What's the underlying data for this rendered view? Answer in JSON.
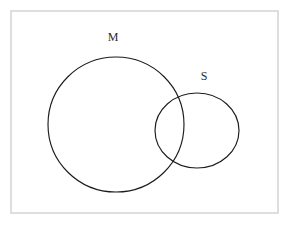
{
  "figure": {
    "type": "euler-diagram",
    "background_color": "#ffffff",
    "frame": {
      "name": "universe-frame",
      "x": 11,
      "y": 11,
      "width": 267,
      "height": 202,
      "stroke_color": "#d6d6d6",
      "stroke_width": 1.6,
      "fill_color": "#ffffff"
    },
    "stroke_color": "#1c1c1c",
    "stroke_width": 1.15,
    "sets": [
      {
        "id": "M",
        "label": "M",
        "shape": "circle",
        "cx": 116,
        "cy": 124.5,
        "rx": 68,
        "ry": 67.5,
        "label_x": 113,
        "label_y": 41
      },
      {
        "id": "S",
        "label": "S",
        "shape": "ellipse",
        "cx": 197,
        "cy": 130.5,
        "rx": 42,
        "ry": 37.5,
        "label_x": 204,
        "label_y": 80
      }
    ],
    "relation": "overlapping"
  }
}
